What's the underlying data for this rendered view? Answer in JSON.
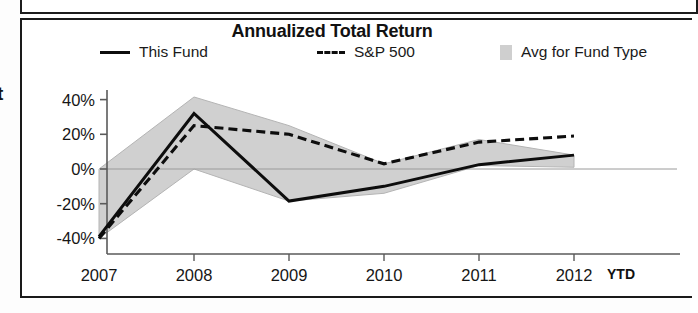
{
  "panel": {
    "clipped_edge_text": "t"
  },
  "chart": {
    "title": "Annualized Total Return",
    "legend": [
      {
        "label": "This Fund",
        "marker": "solid-line-swatch"
      },
      {
        "label": "S&P 500",
        "marker": "dashed-line-swatch"
      },
      {
        "label": "Avg for Fund Type",
        "marker": "gray-area-swatch"
      }
    ],
    "x_axis_note": "YTD",
    "colors": {
      "line_this_fund": "#0d0d0d",
      "line_sp500": "#0d0d0d",
      "band_avg_fund_type": "#d0d0d0",
      "band_edge": "#b4b4b4",
      "axis": "#5a5a5a",
      "zero_line": "#9a9a9a",
      "panel_border": "#1a1a1a"
    }
  },
  "chart_data": {
    "type": "line",
    "title": "Annualized Total Return",
    "xlabel": "",
    "ylabel": "",
    "x": [
      "2007",
      "2008",
      "2009",
      "2010",
      "2011",
      "2012"
    ],
    "tick_labels_x": [
      "2007",
      "2008",
      "2009",
      "2010",
      "2011",
      "2012 YTD"
    ],
    "tick_labels_y": [
      "40%",
      "20%",
      "0%",
      "-20%",
      "-40%"
    ],
    "ticks_y": [
      40,
      20,
      0,
      -20,
      -40
    ],
    "ylim": [
      -50,
      48
    ],
    "grid": false,
    "zero_line": true,
    "legend_position": "top",
    "units": "percent",
    "series": [
      {
        "name": "This Fund",
        "style": "solid",
        "values": [
          -39,
          32,
          -18.5,
          -10,
          2.5,
          8
        ]
      },
      {
        "name": "S&P 500",
        "style": "dashed",
        "values": [
          -40,
          25,
          20,
          3,
          15.5,
          19
        ]
      },
      {
        "name": "Avg for Fund Type",
        "style": "band",
        "upper": [
          0,
          41.5,
          25,
          3,
          17,
          8
        ],
        "lower": [
          -40,
          0,
          -18.5,
          -14,
          2,
          1
        ]
      }
    ]
  }
}
